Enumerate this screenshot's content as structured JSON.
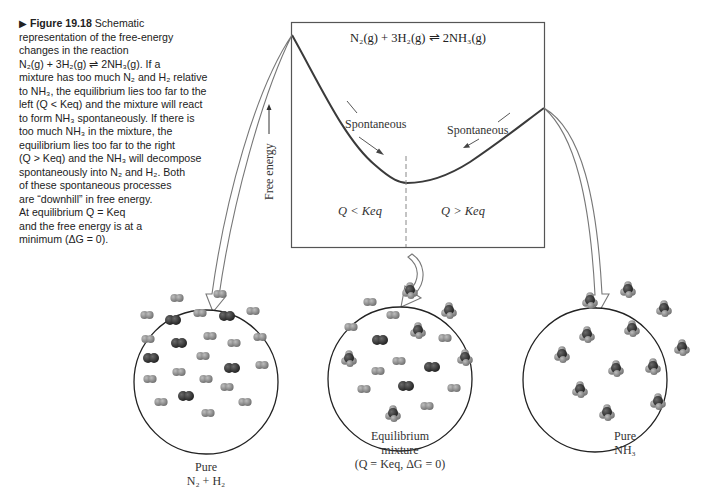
{
  "caption": {
    "marker": "▶",
    "figure_number": "Figure 19.18",
    "text_lines": [
      "Schematic",
      "representation of the free-energy",
      "changes in the reaction",
      "N₂(g) + 3H₂(g) ⇌ 2NH₃(g). If a",
      "mixture has too much N₂ and H₂ relative",
      "to NH₃, the equilibrium lies too far to the",
      "left (Q < Keq) and the mixture will react",
      "to form NH₃ spontaneously. If there is",
      "too much NH₃ in the mixture, the",
      "equilibrium lies too far to the right",
      "(Q > Keq) and the NH₃ will decompose",
      "spontaneously into N₂ and H₂. Both",
      "of these spontaneous processes",
      "are “downhill” in free energy.",
      "At equilibrium Q = Keq",
      "and the free energy is at a",
      "minimum (ΔG = 0)."
    ]
  },
  "graph": {
    "equation": "N₂(g) + 3H₂(g) ⇌ 2NH₃(g)",
    "y_axis_label": "Free energy",
    "left_arrow_label": "Spontaneous",
    "right_arrow_label": "Spontaneous",
    "left_region_label": "Q < Keq",
    "right_region_label": "Q > Keq"
  },
  "panels": [
    {
      "line1": "Pure",
      "line2": "N₂ + H₂",
      "line3": ""
    },
    {
      "line1": "Equilibrium",
      "line2": "mixture",
      "line3": "(Q = Keq, ΔG = 0)"
    },
    {
      "line1": "Pure",
      "line2": "NH₃",
      "line3": ""
    }
  ],
  "colors": {
    "frame": "#555555",
    "curve": "#3a3a3a",
    "h2_molecule": "#8a8a8a",
    "n2_molecule": "#2e2e2e",
    "arrow_outline": "#777777"
  }
}
